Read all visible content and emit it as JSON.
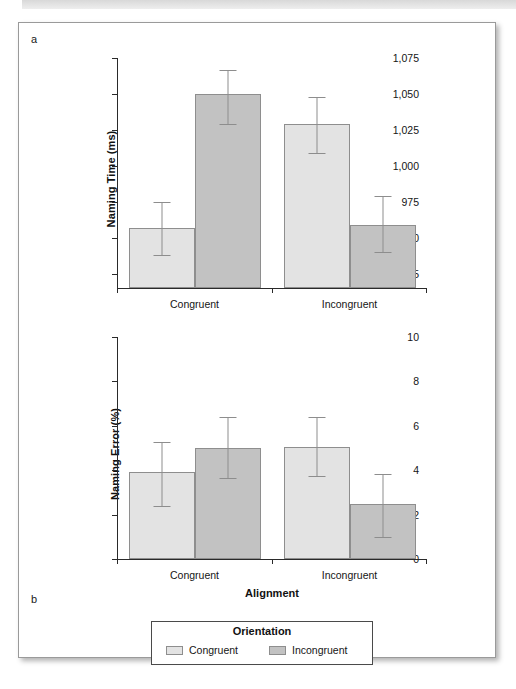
{
  "figure": {
    "panel_a_letter": "a",
    "panel_b_letter": "b"
  },
  "legend": {
    "title": "Orientation",
    "entries": [
      {
        "label": "Congruent",
        "color": "#e3e3e3"
      },
      {
        "label": "Incongruent",
        "color": "#c2c2c2"
      }
    ]
  },
  "chart_data": [
    {
      "panel": "a",
      "type": "bar",
      "title": "",
      "xlabel": "",
      "ylabel": "Naming Time (ms)",
      "categories": [
        "Congruent",
        "Incongruent"
      ],
      "ylim": [
        915,
        1075
      ],
      "yticks": [
        925,
        950,
        975,
        1000,
        1025,
        1050,
        1075
      ],
      "ytick_labels": [
        "925",
        "950",
        "975",
        "1,000",
        "1,025",
        "1,050",
        "1,075"
      ],
      "grid": false,
      "legend_position": "bottom",
      "series": [
        {
          "name": "Congruent",
          "color": "#e3e3e3",
          "values": [
            957,
            1029
          ],
          "error_low": [
            938,
            1009
          ],
          "error_high": [
            975,
            1048
          ]
        },
        {
          "name": "Incongruent",
          "color": "#c2c2c2",
          "values": [
            1050,
            959
          ],
          "error_low": [
            1029,
            940
          ],
          "error_high": [
            1067,
            979
          ]
        }
      ]
    },
    {
      "panel": "b",
      "type": "bar",
      "title": "",
      "xlabel": "Alignment",
      "ylabel": "Naming Error (%)",
      "categories": [
        "Congruent",
        "Incongruent"
      ],
      "ylim": [
        0,
        10
      ],
      "yticks": [
        0,
        2,
        4,
        6,
        8,
        10
      ],
      "ytick_labels": [
        "0",
        "2",
        "4",
        "6",
        "8",
        "10"
      ],
      "grid": false,
      "legend_position": "bottom",
      "series": [
        {
          "name": "Congruent",
          "color": "#e3e3e3",
          "values": [
            3.9,
            5.05
          ],
          "error_low": [
            2.4,
            3.75
          ],
          "error_high": [
            5.25,
            6.4
          ]
        },
        {
          "name": "Incongruent",
          "color": "#c2c2c2",
          "values": [
            5.0,
            2.5
          ],
          "error_low": [
            3.65,
            1.0
          ],
          "error_high": [
            6.4,
            3.85
          ]
        }
      ]
    }
  ]
}
